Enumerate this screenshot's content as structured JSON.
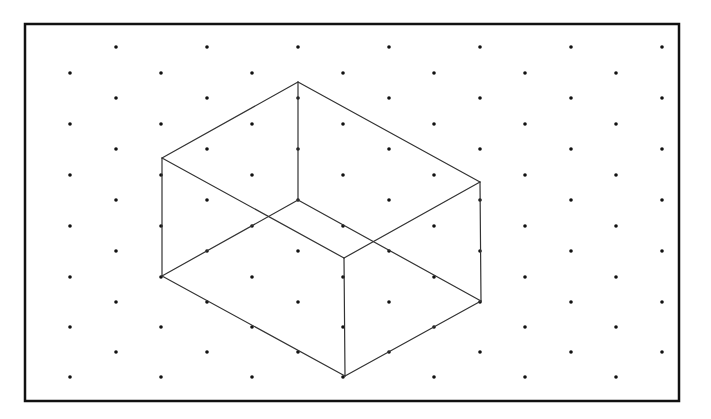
{
  "colors": {
    "background": "#ffffff",
    "frame": "#111111",
    "dots": "#111111",
    "edges": "#333333"
  },
  "frame": {
    "x": 25,
    "y": 24,
    "width": 654,
    "height": 377,
    "stroke_width": 2.5
  },
  "dot_grid": {
    "dot_radius": 1.8,
    "rows": [
      {
        "y": 47,
        "x_start": 116,
        "count": 7
      },
      {
        "y": 73,
        "x_start": 70,
        "count": 7
      },
      {
        "y": 98,
        "x_start": 116,
        "count": 7
      },
      {
        "y": 124,
        "x_start": 70,
        "count": 7
      },
      {
        "y": 149,
        "x_start": 116,
        "count": 7
      },
      {
        "y": 175,
        "x_start": 70,
        "count": 7
      },
      {
        "y": 200,
        "x_start": 116,
        "count": 7
      },
      {
        "y": 226,
        "x_start": 70,
        "count": 7
      },
      {
        "y": 251,
        "x_start": 116,
        "count": 7
      },
      {
        "y": 277,
        "x_start": 70,
        "count": 7
      },
      {
        "y": 302,
        "x_start": 116,
        "count": 7
      },
      {
        "y": 327,
        "x_start": 70,
        "count": 7
      },
      {
        "y": 352,
        "x_start": 116,
        "count": 7
      },
      {
        "y": 377,
        "x_start": 70,
        "count": 7
      }
    ],
    "x_step": 91
  },
  "box": {
    "vertices": {
      "top_back": [
        298,
        82
      ],
      "left": [
        162,
        158
      ],
      "right": [
        480,
        182
      ],
      "front_top": [
        344,
        258
      ],
      "inner_bottom": [
        298,
        200
      ],
      "bottom_left": [
        162,
        276
      ],
      "bottom_right": [
        481,
        301
      ],
      "bottom_front": [
        345,
        376
      ]
    },
    "edges": [
      [
        "top_back",
        "left"
      ],
      [
        "top_back",
        "right"
      ],
      [
        "left",
        "front_top"
      ],
      [
        "right",
        "front_top"
      ],
      [
        "top_back",
        "inner_bottom"
      ],
      [
        "inner_bottom",
        "bottom_left"
      ],
      [
        "inner_bottom",
        "bottom_right"
      ],
      [
        "left",
        "bottom_left"
      ],
      [
        "right",
        "bottom_right"
      ],
      [
        "front_top",
        "bottom_front"
      ],
      [
        "bottom_left",
        "bottom_front"
      ],
      [
        "bottom_right",
        "bottom_front"
      ]
    ],
    "stroke_width": 1.2
  }
}
